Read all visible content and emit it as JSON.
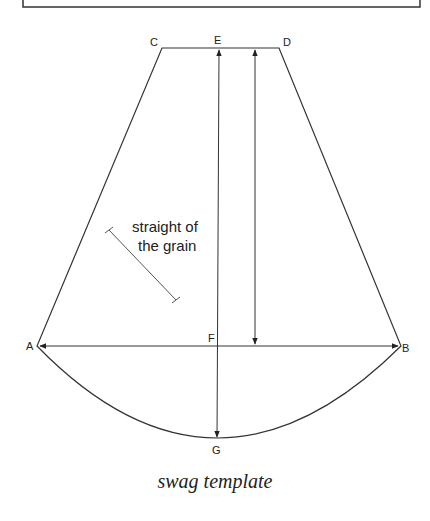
{
  "caption": "swag template",
  "points": {
    "A": "A",
    "B": "B",
    "C": "C",
    "D": "D",
    "E": "E",
    "F": "F",
    "G": "G"
  },
  "annotation": {
    "line1": "straight of",
    "line2": "the grain"
  },
  "colors": {
    "line": "#333333",
    "text": "#222222"
  }
}
